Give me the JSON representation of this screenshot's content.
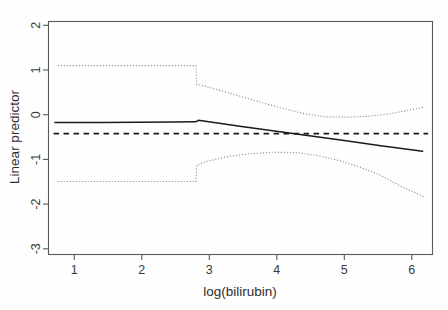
{
  "chart_data": {
    "type": "line",
    "title": "",
    "xlabel": "log(bilirubin)",
    "ylabel": "Linear predictor",
    "xlim": [
      0.72,
      6.25
    ],
    "ylim": [
      -3.15,
      2.2
    ],
    "xticks": [
      1,
      2,
      3,
      4,
      5,
      6
    ],
    "yticks": [
      2,
      1,
      0,
      -1,
      -2,
      -3
    ],
    "xtick_labels": [
      "1",
      "2",
      "3",
      "4",
      "5",
      "6"
    ],
    "ytick_labels": [
      "2",
      "1",
      "0",
      "-1",
      "-2",
      "-3"
    ],
    "grid": false,
    "legend": "none",
    "series": [
      {
        "name": "Linear predictor (fitted)",
        "style": "solid",
        "color": "#1a1a1a",
        "points": [
          [
            0.82,
            -0.12
          ],
          [
            1.5,
            -0.12
          ],
          [
            2.0,
            -0.115
          ],
          [
            2.5,
            -0.11
          ],
          [
            2.84,
            -0.105
          ],
          [
            2.88,
            -0.07
          ],
          [
            3.5,
            -0.21
          ],
          [
            4.0,
            -0.32
          ],
          [
            4.5,
            -0.43
          ],
          [
            5.0,
            -0.54
          ],
          [
            5.5,
            -0.65
          ],
          [
            6.1,
            -0.78
          ]
        ]
      },
      {
        "name": "Reference (null) level",
        "style": "dashed",
        "color": "#1a1a1a",
        "points": [
          [
            0.8,
            -0.375
          ],
          [
            6.18,
            -0.375
          ]
        ]
      },
      {
        "name": "Upper 95% confidence limit",
        "style": "dotted",
        "color": "#8d8d8d",
        "points": [
          [
            0.86,
            1.18
          ],
          [
            1.5,
            1.18
          ],
          [
            2.0,
            1.18
          ],
          [
            2.5,
            1.18
          ],
          [
            2.845,
            1.18
          ],
          [
            2.855,
            0.755
          ],
          [
            3.0,
            0.7
          ],
          [
            3.4,
            0.52
          ],
          [
            3.8,
            0.33
          ],
          [
            4.1,
            0.2
          ],
          [
            4.4,
            0.08
          ],
          [
            4.7,
            0.01
          ],
          [
            5.0,
            0.0
          ],
          [
            5.3,
            0.02
          ],
          [
            5.6,
            0.07
          ],
          [
            5.9,
            0.16
          ],
          [
            6.12,
            0.23
          ]
        ]
      },
      {
        "name": "Lower 95% confidence limit",
        "style": "dotted",
        "color": "#8d8d8d",
        "points": [
          [
            0.86,
            -1.47
          ],
          [
            1.5,
            -1.47
          ],
          [
            2.0,
            -1.47
          ],
          [
            2.5,
            -1.47
          ],
          [
            2.845,
            -1.47
          ],
          [
            2.855,
            -1.1
          ],
          [
            3.0,
            -1.01
          ],
          [
            3.3,
            -0.9
          ],
          [
            3.6,
            -0.84
          ],
          [
            3.95,
            -0.8
          ],
          [
            4.3,
            -0.81
          ],
          [
            4.6,
            -0.88
          ],
          [
            4.9,
            -0.99
          ],
          [
            5.2,
            -1.14
          ],
          [
            5.5,
            -1.33
          ],
          [
            5.8,
            -1.59
          ],
          [
            6.0,
            -1.73
          ],
          [
            6.12,
            -1.82
          ]
        ]
      }
    ],
    "annotations": {
      "discontinuity_x": 2.85,
      "crossing_x": 4.05
    }
  },
  "figure": {
    "plot_box": {
      "left": 48,
      "top": 21,
      "right": 433,
      "bottom": 255
    }
  }
}
